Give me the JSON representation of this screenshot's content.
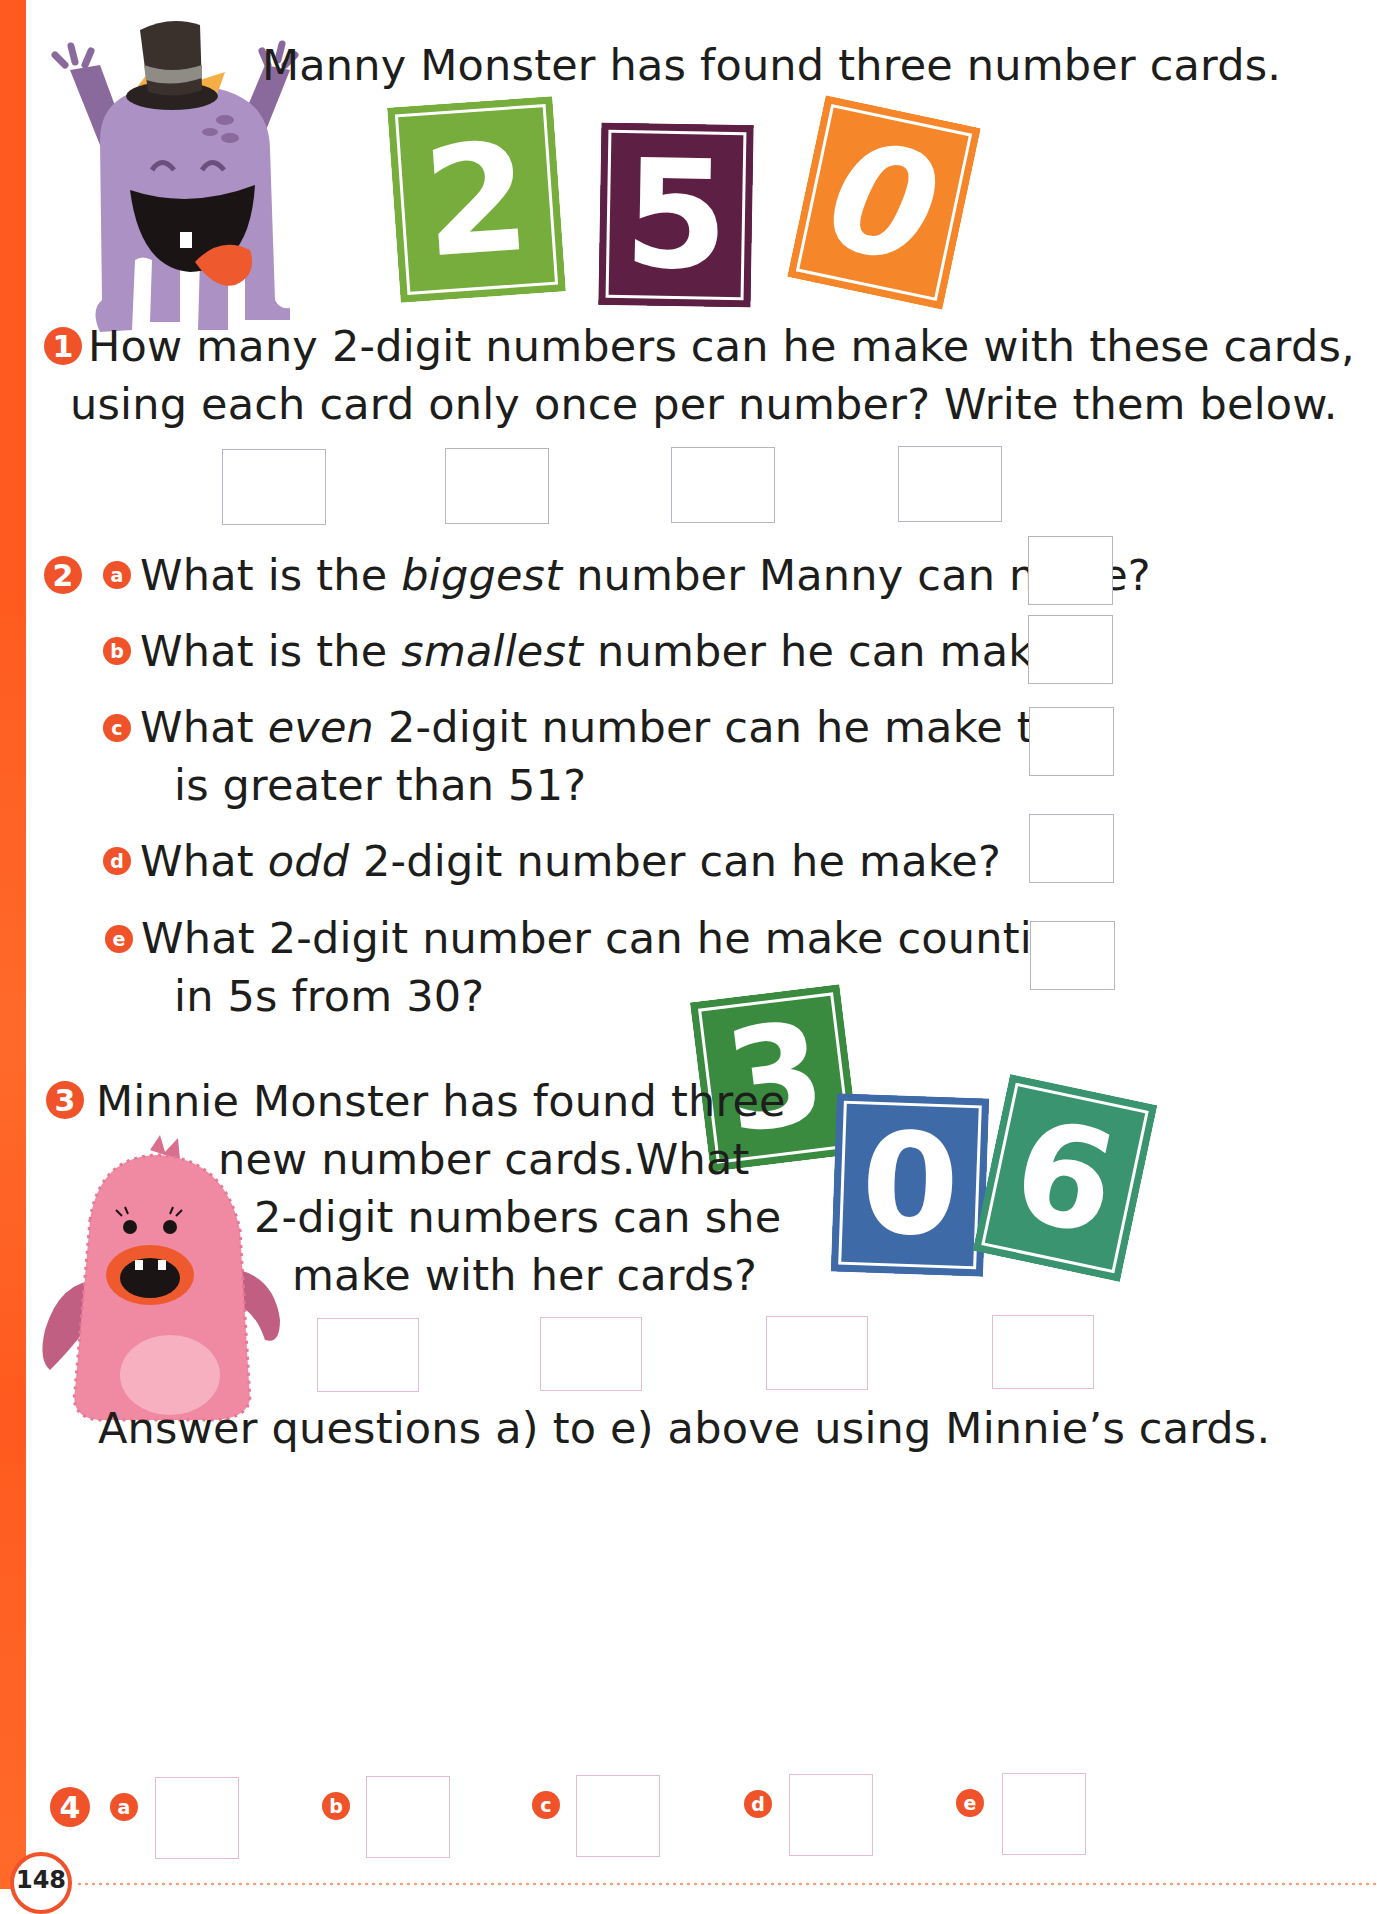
{
  "page": {
    "page_number": "148",
    "accent_color": "#f0532a"
  },
  "intro": {
    "text": "Manny Monster has found three number cards.",
    "character": "Manny Monster"
  },
  "manny_cards": [
    {
      "digit": "2",
      "color": "#77ad3c"
    },
    {
      "digit": "5",
      "color": "#5e1f45"
    },
    {
      "digit": "0",
      "color": "#f6862a"
    }
  ],
  "q1": {
    "number": "1",
    "line1": "How many 2-digit numbers can he make with these cards,",
    "line2": "using each card only once per number? Write them below.",
    "answer_boxes": 4
  },
  "q2": {
    "number": "2",
    "parts": [
      {
        "letter": "a",
        "pre": "What is the ",
        "em": "biggest",
        "post": " number Manny can make?",
        "line2": ""
      },
      {
        "letter": "b",
        "pre": "What is the ",
        "em": "smallest",
        "post": " number he can make?",
        "line2": ""
      },
      {
        "letter": "c",
        "pre": "What ",
        "em": "even",
        "post": " 2-digit number can he make that",
        "line2": "is greater than 51?"
      },
      {
        "letter": "d",
        "pre": "What ",
        "em": "odd",
        "post": " 2-digit number can he make?",
        "line2": ""
      },
      {
        "letter": "e",
        "pre": "What 2-digit number can he make counting",
        "em": "",
        "post": "",
        "line2": "in 5s from 30?"
      }
    ]
  },
  "q3": {
    "number": "3",
    "lines": [
      "Minnie Monster has found three",
      "new number cards.What",
      "2-digit numbers can she",
      "make with her cards?"
    ],
    "character": "Minnie Monster",
    "answer_boxes": 4
  },
  "minnie_cards": [
    {
      "digit": "3",
      "color": "#3a8a3f"
    },
    {
      "digit": "0",
      "color": "#3f6aa8"
    },
    {
      "digit": "6",
      "color": "#3a9470"
    }
  ],
  "instruction": "Answer questions a) to e) above using Minnie’s cards.",
  "q4": {
    "number": "4",
    "letters": [
      "a",
      "b",
      "c",
      "d",
      "e"
    ]
  }
}
